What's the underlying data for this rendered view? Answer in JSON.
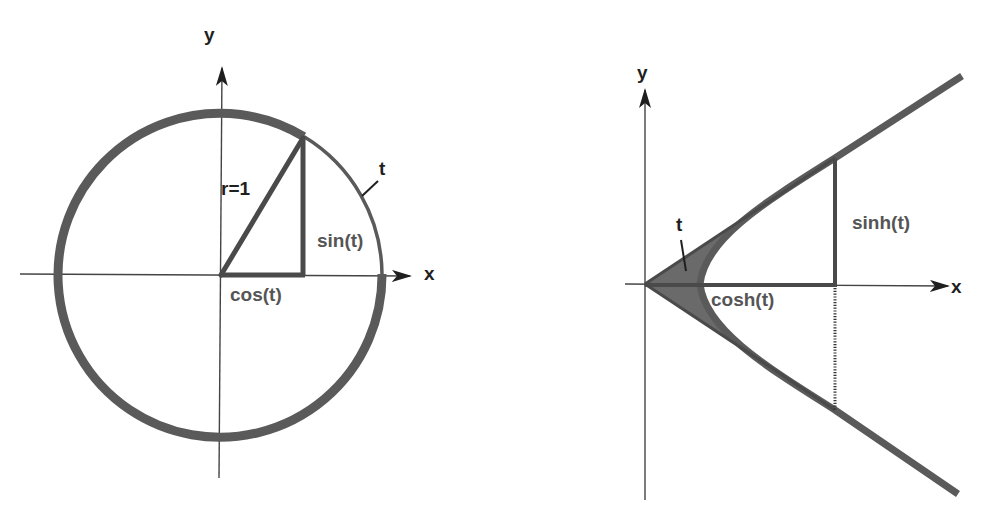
{
  "figure": {
    "left_panel": {
      "title": "unit-circle",
      "axis_labels": {
        "x": "x",
        "y": "y"
      },
      "labels": {
        "radius": "r=1",
        "sine": "sin(t)",
        "cosine": "cos(t)",
        "arc": "t"
      },
      "geometry": {
        "center": [
          220,
          274
        ],
        "radius": 162,
        "point": [
          303,
          137
        ],
        "angle_deg": 58
      }
    },
    "right_panel": {
      "title": "unit-hyperbola",
      "axis_labels": {
        "x": "x",
        "y": "y"
      },
      "labels": {
        "sinh": "sinh(t)",
        "cosh": "cosh(t)",
        "area": "t"
      },
      "geometry": {
        "origin": [
          645,
          284
        ],
        "vertex": [
          700,
          284
        ],
        "point_upper": [
          835,
          158
        ],
        "point_lower": [
          835,
          410
        ]
      }
    },
    "colors": {
      "stroke_dark": "#1f1f1f",
      "stroke_gray": "#5a5a5a",
      "fill_shaded": "#6a6a6a",
      "axis": "#444444"
    },
    "caption": {
      "visible": "partially cut off at bottom edge (illegible)"
    }
  }
}
